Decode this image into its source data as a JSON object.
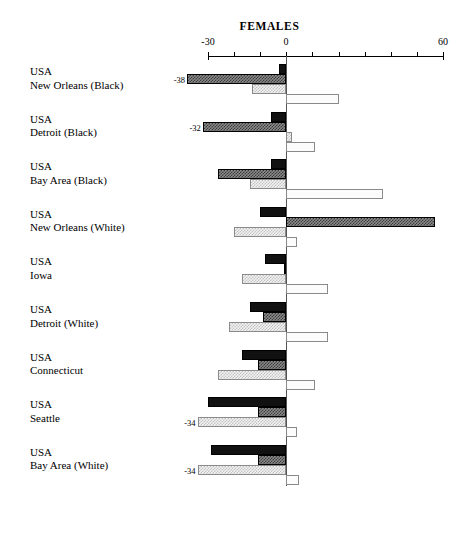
{
  "chart": {
    "title": "FEMALES",
    "type": "bar",
    "orientation": "horizontal",
    "grid": false,
    "legend": "none"
  },
  "axis": {
    "label": "",
    "min": -30,
    "max": 60,
    "tick_labels": [
      "-30",
      "0",
      "60"
    ],
    "tick_values": [
      -30,
      0,
      60
    ],
    "minor_tick_step": 10,
    "position": "top"
  },
  "chart_data": {
    "type": "bar",
    "title": "FEMALES",
    "xlabel": "",
    "ylabel": "",
    "xlim": [
      -30,
      60
    ],
    "grid": false,
    "orientation": "horizontal",
    "categories": [
      "USA New Orleans (Black)",
      "USA Detroit (Black)",
      "USA Bay Area (Black)",
      "USA New Orleans (White)",
      "USA Iowa",
      "USA Detroit (White)",
      "USA Connecticut",
      "USA Seattle",
      "USA Bay Area (White)"
    ],
    "series": [
      {
        "name": "series-1",
        "style": "solid-black",
        "values": [
          -3,
          -6,
          -6,
          -10,
          -8,
          -14,
          -17,
          -30,
          -29
        ]
      },
      {
        "name": "series-2",
        "style": "dark-hatched",
        "values": [
          -38,
          -32,
          -26,
          57,
          -1,
          -9,
          -11,
          -11,
          -11
        ]
      },
      {
        "name": "series-3",
        "style": "light-hatched",
        "values": [
          -13,
          2,
          -14,
          -20,
          -17,
          -22,
          -26,
          -34,
          -34
        ]
      },
      {
        "name": "series-4",
        "style": "white-open",
        "values": [
          20,
          11,
          37,
          4,
          16,
          16,
          11,
          4,
          5
        ]
      }
    ],
    "data_labels": [
      {
        "category_index": 0,
        "series_index": 1,
        "text": "-38"
      },
      {
        "category_index": 1,
        "series_index": 1,
        "text": "-32"
      },
      {
        "category_index": 7,
        "series_index": 2,
        "text": "-34"
      },
      {
        "category_index": 8,
        "series_index": 2,
        "text": "-34"
      }
    ]
  },
  "categories": [
    {
      "line1": "USA",
      "line2": "New Orleans (Black)"
    },
    {
      "line1": "USA",
      "line2": "Detroit (Black)"
    },
    {
      "line1": "USA",
      "line2": "Bay Area (Black)"
    },
    {
      "line1": "USA",
      "line2": "New Orleans (White)"
    },
    {
      "line1": "USA",
      "line2": "Iowa"
    },
    {
      "line1": "USA",
      "line2": "Detroit (White)"
    },
    {
      "line1": "USA",
      "line2": "Connecticut"
    },
    {
      "line1": "USA",
      "line2": "Seattle"
    },
    {
      "line1": "USA",
      "line2": "Bay Area (White)"
    }
  ],
  "colors": {
    "series_1": "#111111",
    "series_2": "#3a3a3a",
    "series_3": "#c2c2c2",
    "series_4": "#fcfcfc",
    "axis": "#000000",
    "zero_line": "#555555",
    "background": "#ffffff"
  }
}
